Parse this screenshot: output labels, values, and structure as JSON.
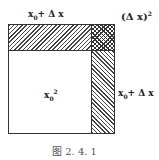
{
  "figure": {
    "caption": "图 2. 4. 1",
    "labels": {
      "top_side": {
        "base": "x",
        "sub": "0",
        "rest": "+ Δ x"
      },
      "right_side": {
        "base": "x",
        "sub": "0",
        "rest": "+ Δ x"
      },
      "corner": {
        "text": "(Δ x)",
        "sup": "2"
      },
      "center": {
        "base": "x",
        "sub": "0",
        "sup": "2"
      }
    },
    "regions": [
      {
        "name": "main-square",
        "area": "x0^2",
        "fill": "white"
      },
      {
        "name": "top-strip",
        "area": "x0·Δx",
        "fill": "diagonal-hatch"
      },
      {
        "name": "right-strip",
        "area": "x0·Δx",
        "fill": "diagonal-hatch"
      },
      {
        "name": "corner-square",
        "area": "(Δx)^2",
        "fill": "cross-hatch"
      }
    ],
    "colors": {
      "line": "#333333",
      "background": "#ffffff",
      "caption": "#555555"
    }
  }
}
